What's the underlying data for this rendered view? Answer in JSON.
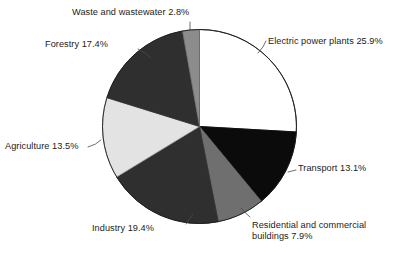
{
  "chart_data": {
    "type": "pie",
    "title": "",
    "xlabel": "",
    "ylabel": "",
    "units": "%",
    "legend_position": "none",
    "label_style": "external-callout-with-leader-line",
    "start_angle_deg": 0,
    "direction": "clockwise",
    "categories": [
      "Electric power plants",
      "Transport",
      "Residential and commercial buildings",
      "Industry",
      "Agriculture",
      "Forestry",
      "Waste and wastewater"
    ],
    "values": [
      25.9,
      13.1,
      7.9,
      19.4,
      13.5,
      17.4,
      2.8
    ],
    "total": 100.0,
    "slices": [
      {
        "name": "electric-power-plants",
        "label": "Electric power plants 25.9%",
        "category": "Electric power plants",
        "value": 25.9,
        "color": "#ffffff",
        "stroke": "#1a1a1a"
      },
      {
        "name": "transport",
        "label": "Transport 13.1%",
        "category": "Transport",
        "value": 13.1,
        "color": "#0b0b0b",
        "stroke": "#0b0b0b"
      },
      {
        "name": "residential-and-commercial-buildings",
        "label": "Residential and commercial buildings 7.9%",
        "label_line1": "Residential and commercial",
        "label_line2": "buildings 7.9%",
        "category": "Residential and commercial buildings",
        "value": 7.9,
        "color": "#6f6f6f",
        "stroke": "#5a5a5a"
      },
      {
        "name": "industry",
        "label": "Industry 19.4%",
        "category": "Industry",
        "value": 19.4,
        "color": "#2f2f2f",
        "stroke": "#2f2f2f"
      },
      {
        "name": "agriculture",
        "label": "Agriculture 13.5%",
        "category": "Agriculture",
        "value": 13.5,
        "color": "#e3e3e3",
        "stroke": "#9a9a9a"
      },
      {
        "name": "forestry",
        "label": "Forestry 17.4%",
        "category": "Forestry",
        "value": 17.4,
        "color": "#2f2f2f",
        "stroke": "#2f2f2f"
      },
      {
        "name": "waste-and-wastewater",
        "label": "Waste and wastewater 2.8%",
        "category": "Waste and wastewater",
        "value": 2.8,
        "color": "#8c8c8c",
        "stroke": "#6f6f6f"
      }
    ]
  },
  "labels": {
    "electric": "Electric power plants 25.9%",
    "transport": "Transport 13.1%",
    "residential_line1": "Residential and commercial",
    "residential_line2": "buildings 7.9%",
    "industry": "Industry 19.4%",
    "agriculture": "Agriculture 13.5%",
    "forestry": "Forestry 17.4%",
    "waste": "Waste and wastewater 2.8%"
  },
  "colors": {
    "background": "#ffffff",
    "text": "#1c1c1c",
    "outline": "#1a1a1a",
    "leader_line": "#4a4a4a"
  }
}
